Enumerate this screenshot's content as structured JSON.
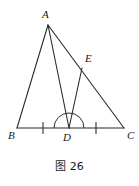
{
  "figure": {
    "caption": "图 26",
    "stroke_color": "#2b2b2b",
    "background_color": "#ffffff",
    "label_color": "#1a1a1a",
    "labels": {
      "a": "A",
      "b": "B",
      "c": "C",
      "d": "D",
      "e": "E"
    },
    "points": {
      "a": {
        "x": 48,
        "y": 25
      },
      "b": {
        "x": 17,
        "y": 128
      },
      "c": {
        "x": 124,
        "y": 128
      },
      "d": {
        "x": 69,
        "y": 128
      },
      "e": {
        "x": 82,
        "y": 68
      }
    },
    "segments": [
      {
        "name": "ab",
        "from": "a",
        "to": "b"
      },
      {
        "name": "ac",
        "from": "a",
        "to": "c"
      },
      {
        "name": "bc",
        "from": "b",
        "to": "c"
      },
      {
        "name": "ad",
        "from": "a",
        "to": "d"
      },
      {
        "name": "de",
        "from": "d",
        "to": "e"
      }
    ],
    "tick_marks": [
      {
        "name": "tick-bd",
        "x": 43,
        "y": 128,
        "segment": "bd"
      },
      {
        "name": "tick-dc",
        "x": 96,
        "y": 128,
        "segment": "dc"
      }
    ],
    "angle_arc": {
      "name": "angle-arc-at-d",
      "center_x": 69,
      "center_y": 128,
      "radius": 15
    }
  }
}
